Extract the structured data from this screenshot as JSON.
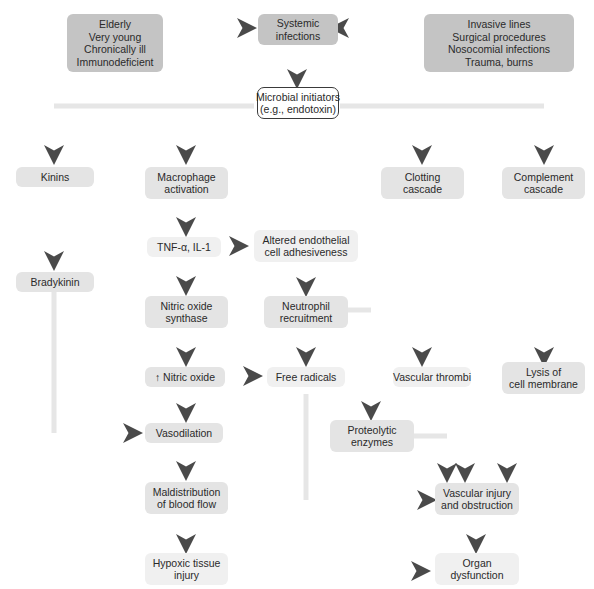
{
  "diagram": {
    "nodes": {
      "risk_host": {
        "lines": [
          "Elderly",
          "Very young",
          "Chronically ill",
          "Immunodeficient"
        ]
      },
      "systemic": {
        "lines": [
          "Systemic",
          "infections"
        ]
      },
      "risk_iatrogenic": {
        "lines": [
          "Invasive lines",
          "Surgical procedures",
          "Nosocomial infections",
          "Trauma, burns"
        ]
      },
      "microbial": {
        "lines": [
          "Microbial initiators",
          "(e.g., endotoxin)"
        ]
      },
      "kinins": {
        "lines": [
          "Kinins"
        ]
      },
      "macrophage": {
        "lines": [
          "Macrophage",
          "activation"
        ]
      },
      "clotting": {
        "lines": [
          "Clotting",
          "cascade"
        ]
      },
      "complement": {
        "lines": [
          "Complement",
          "cascade"
        ]
      },
      "tnf": {
        "lines": [
          "TNF-α, IL-1"
        ]
      },
      "endothelial": {
        "lines": [
          "Altered endothelial",
          "cell adhesiveness"
        ]
      },
      "bradykinin": {
        "lines": [
          "Bradykinin"
        ]
      },
      "nos": {
        "lines": [
          "Nitric oxide",
          "synthase"
        ]
      },
      "neutrophil": {
        "lines": [
          "Neutrophil",
          "recruitment"
        ]
      },
      "nitric_oxide": {
        "lines": [
          "↑ Nitric oxide"
        ]
      },
      "free_radicals": {
        "lines": [
          "Free radicals"
        ]
      },
      "thrombi": {
        "lines": [
          "Vascular thrombi"
        ]
      },
      "lysis": {
        "lines": [
          "Lysis of",
          "cell membrane"
        ]
      },
      "vasodilation": {
        "lines": [
          "Vasodilation"
        ]
      },
      "proteolytic": {
        "lines": [
          "Proteolytic",
          "enzymes"
        ]
      },
      "maldistribution": {
        "lines": [
          "Maldistribution",
          "of blood flow"
        ]
      },
      "vascular_injury": {
        "lines": [
          "Vascular injury",
          "and obstruction"
        ]
      },
      "hypoxic": {
        "lines": [
          "Hypoxic tissue",
          "injury"
        ]
      },
      "organ": {
        "lines": [
          "Organ",
          "dysfunction"
        ]
      }
    },
    "colors": {
      "dark_box": "#c4c4c4",
      "mid_box": "#e4e4e4",
      "light_box": "#f0f0f0",
      "arrow_dark": "#4a4a4a",
      "arrow_light": "#e6e6e6",
      "text": "#2a2a2a"
    }
  }
}
